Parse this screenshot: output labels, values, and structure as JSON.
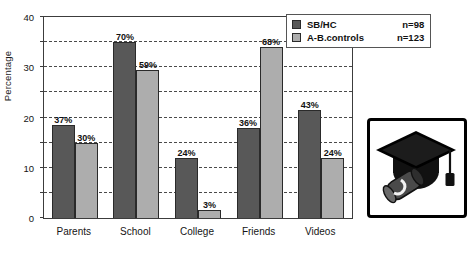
{
  "chart_data": {
    "type": "bar",
    "title": "",
    "xlabel": "",
    "ylabel": "Percentage",
    "ylim": [
      0,
      80
    ],
    "ytick_step": 10,
    "yticks": [
      0,
      10,
      20,
      30,
      40,
      50,
      60,
      70,
      80
    ],
    "ytick_labels": [
      "0",
      "10",
      "20",
      "30",
      "40",
      "50",
      "60",
      "70",
      "80"
    ],
    "grid": true,
    "legend_position": "top-right",
    "categories": [
      "Parents",
      "School",
      "College",
      "Friends",
      "Videos"
    ],
    "series": [
      {
        "name": "SB/HC",
        "n_label": "n=98",
        "color": "#585858",
        "values": [
          37,
          70,
          24,
          36,
          43
        ],
        "value_labels": [
          "37%",
          "70%",
          "24%",
          "36%",
          "43%"
        ]
      },
      {
        "name": "A-B.controls",
        "n_label": "n=123",
        "color": "#adadad",
        "values": [
          30,
          59,
          3,
          68,
          24
        ],
        "value_labels": [
          "30%",
          "59%",
          "3%",
          "68%",
          "24%"
        ]
      }
    ]
  },
  "legend": {
    "rows": [
      {
        "label": "SB/HC",
        "count": "n=98"
      },
      {
        "label": "A-B.controls",
        "count": "n=123"
      }
    ]
  },
  "decoration": {
    "graduation_icon": "graduation-cap-diploma-icon"
  },
  "colors": {
    "series1": "#585858",
    "series2": "#adadad",
    "axis": "#3c3c3c",
    "grid": "#4a4a4a",
    "text": "#111111",
    "background": "#ffffff"
  }
}
